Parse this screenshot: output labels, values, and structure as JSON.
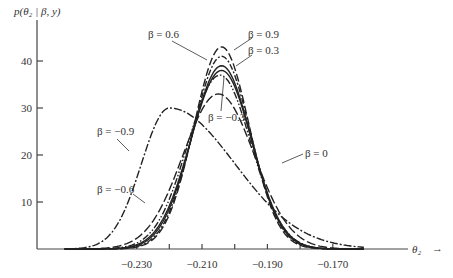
{
  "chart_data": {
    "type": "line",
    "title": "",
    "xlabel": "θ₂",
    "ylabel": "p(θ₂ | β, y)",
    "xlim": [
      -0.252,
      -0.16
    ],
    "ylim": [
      0,
      45
    ],
    "grid": false,
    "x_ticks": [
      {
        "value": -0.23,
        "label": "−0.230"
      },
      {
        "value": -0.22,
        "label": ""
      },
      {
        "value": -0.21,
        "label": "−0.210"
      },
      {
        "value": -0.2,
        "label": ""
      },
      {
        "value": -0.19,
        "label": "−0.190"
      },
      {
        "value": -0.18,
        "label": ""
      },
      {
        "value": -0.17,
        "label": "−0.170"
      }
    ],
    "y_ticks": [
      {
        "value": 10,
        "label": "10"
      },
      {
        "value": 20,
        "label": "20"
      },
      {
        "value": 30,
        "label": "30"
      },
      {
        "value": 40,
        "label": "40"
      }
    ],
    "series": [
      {
        "name": "β = 0.9",
        "peak_x": -0.204,
        "peak_y": 43,
        "sigma_left": 0.0085,
        "sigma_right": 0.0085,
        "dash": "8,3"
      },
      {
        "name": "β = 0.6",
        "peak_x": -0.204,
        "peak_y": 41,
        "sigma_left": 0.0088,
        "sigma_right": 0.0088,
        "dash": "6,2,2,2"
      },
      {
        "name": "β = 0.3",
        "peak_x": -0.204,
        "peak_y": 39,
        "sigma_left": 0.0092,
        "sigma_right": 0.009,
        "dash": ""
      },
      {
        "name": "β = 0",
        "peak_x": -0.204,
        "peak_y": 38,
        "sigma_left": 0.0095,
        "sigma_right": 0.0092,
        "dash": ""
      },
      {
        "name": "β = −0.3",
        "peak_x": -0.2045,
        "peak_y": 37,
        "sigma_left": 0.0098,
        "sigma_right": 0.0095,
        "dash": "7,2,1.5,2,1.5,2"
      },
      {
        "name": "β = −0.6",
        "peak_x": -0.205,
        "peak_y": 33,
        "sigma_left": 0.0108,
        "sigma_right": 0.011,
        "dash": "9,3"
      },
      {
        "name": "β = −0.9",
        "peak_x": -0.22,
        "peak_y": 30,
        "sigma_left": 0.0085,
        "sigma_right": 0.02,
        "dash": "8,2,2,2"
      }
    ]
  },
  "labels": {
    "y_axis": "p(θ₂ | β, y)",
    "x_axis": "θ₂",
    "x_arrow": "→",
    "beta_09": "β = 0.9",
    "beta_06": "β = 0.6",
    "beta_03": "β = 0.3",
    "beta_0": "β = 0",
    "beta_m03": "β = −0.3",
    "beta_m06": "β = −0.6",
    "beta_m09": "β = −0.9"
  }
}
